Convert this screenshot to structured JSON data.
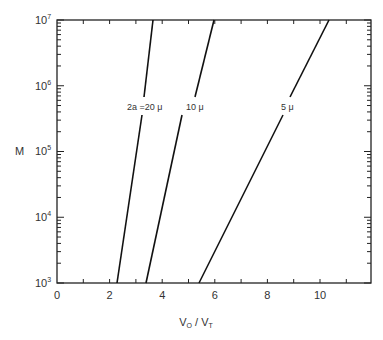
{
  "chart_data": {
    "type": "line",
    "title": "",
    "xlabel": "V0 / VT",
    "ylabel": "M",
    "xlim": [
      0,
      12
    ],
    "ylim": [
      1000,
      10000000
    ],
    "yscale": "log",
    "grid": false,
    "x_ticks": [
      "0",
      "2",
      "4",
      "6",
      "8",
      "10"
    ],
    "y_ticks": [
      "10^3",
      "10^4",
      "10^5",
      "10^6",
      "10^7"
    ],
    "series": [
      {
        "name": "2a = 20 μ",
        "x": [
          2.3,
          3.65
        ],
        "y": [
          1000,
          10000000
        ]
      },
      {
        "name": "10 μ",
        "x": [
          3.4,
          5.95
        ],
        "y": [
          1000,
          10000000
        ]
      },
      {
        "name": "5 μ",
        "x": [
          5.45,
          10.35
        ],
        "y": [
          1000,
          10000000
        ]
      }
    ]
  },
  "labels": {
    "xlabel_main": "V",
    "xlabel_sub1": "O",
    "xlabel_sep": " / ",
    "xlabel_main2": "V",
    "xlabel_sub2": "T",
    "ylabel": "M",
    "series0": "2a =20 μ",
    "series1": "10 μ",
    "series2": "5 μ",
    "xt0": "0",
    "xt1": "2",
    "xt2": "4",
    "xt3": "6",
    "xt4": "8",
    "xt5": "10",
    "yt_base": "10",
    "ye3": "3",
    "ye4": "4",
    "ye5": "5",
    "ye6": "6",
    "ye7": "7"
  }
}
